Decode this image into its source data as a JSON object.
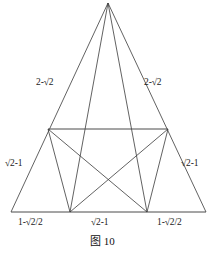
{
  "figure": {
    "caption": "图 10",
    "line_color": "#3a3a3a",
    "background": "#ffffff",
    "labels": {
      "left_upper_side": "2-√2",
      "right_upper_side": "2-√2",
      "left_lower_side": "√2-1",
      "right_lower_side": "√2-1",
      "base_left": "1-√2/2",
      "base_center": "√2-1",
      "base_right": "1-√2/2"
    },
    "geometry": {
      "apex": [
        108,
        3
      ],
      "base_left_corner": [
        11,
        212
      ],
      "base_right_corner": [
        206,
        212
      ],
      "mid_left": [
        48,
        129
      ],
      "mid_right": [
        168,
        129
      ],
      "base_inner_left": [
        70,
        212
      ],
      "base_inner_right": [
        147,
        212
      ]
    }
  }
}
